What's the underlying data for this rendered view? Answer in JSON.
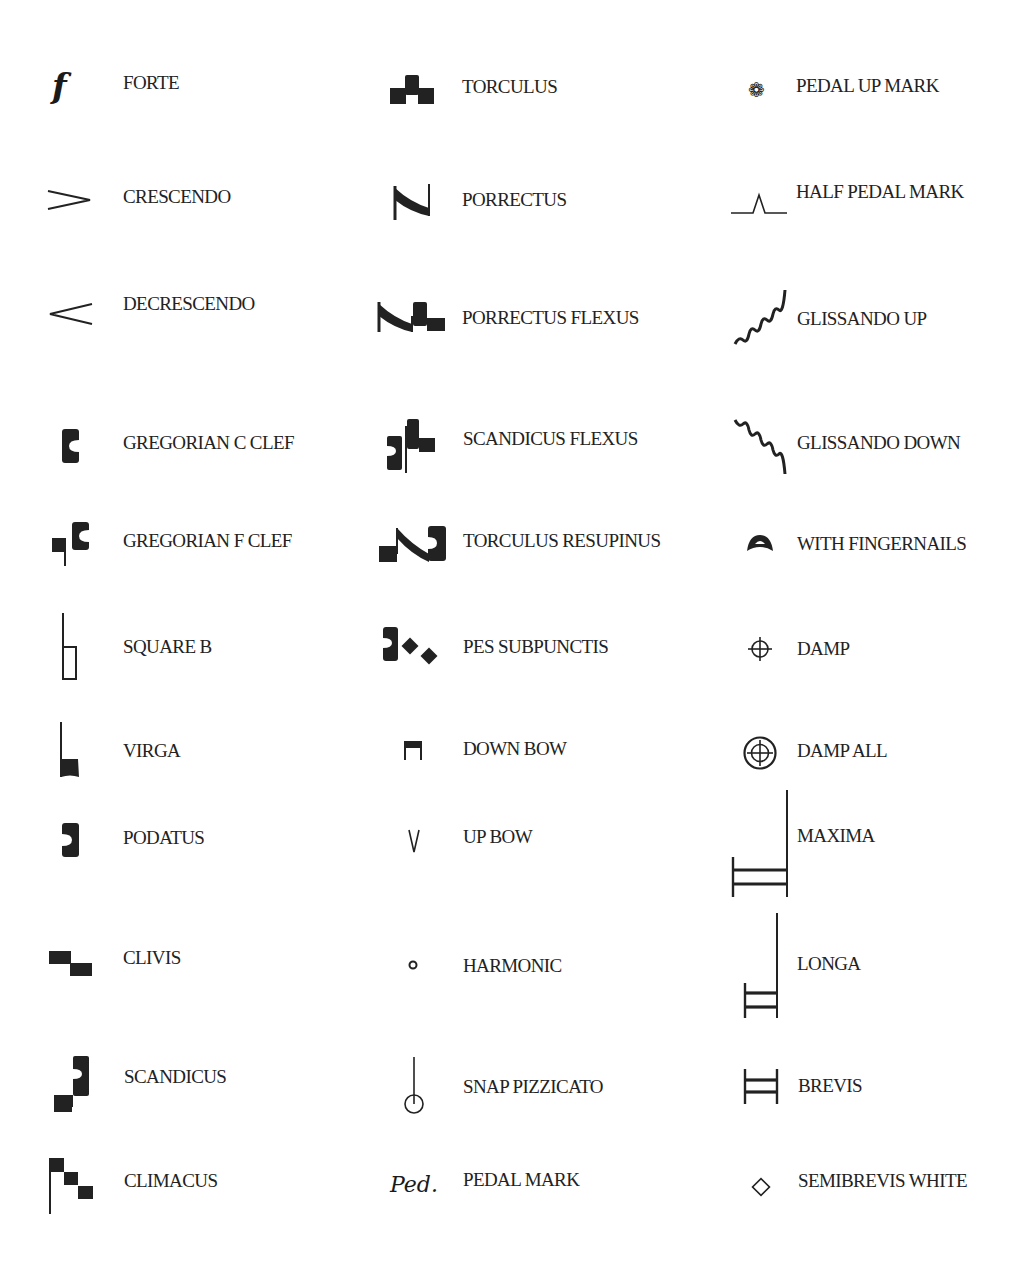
{
  "page": {
    "columns": [
      {
        "items": [
          {
            "label": "FORTE",
            "icon": "forte-icon"
          },
          {
            "label": "CRESCENDO",
            "icon": "crescendo-icon"
          },
          {
            "label": "DECRESCENDO",
            "icon": "decrescendo-icon"
          },
          {
            "label": "GREGORIAN C CLEF",
            "icon": "gregorian-c-clef-icon"
          },
          {
            "label": "GREGORIAN F CLEF",
            "icon": "gregorian-f-clef-icon"
          },
          {
            "label": "SQUARE B",
            "icon": "square-b-icon"
          },
          {
            "label": "VIRGA",
            "icon": "virga-icon"
          },
          {
            "label": "PODATUS",
            "icon": "podatus-icon"
          },
          {
            "label": "CLIVIS",
            "icon": "clivis-icon"
          },
          {
            "label": "SCANDICUS",
            "icon": "scandicus-icon"
          },
          {
            "label": "CLIMACUS",
            "icon": "climacus-icon"
          }
        ]
      },
      {
        "items": [
          {
            "label": "TORCULUS",
            "icon": "torculus-icon"
          },
          {
            "label": "PORRECTUS",
            "icon": "porrectus-icon"
          },
          {
            "label": "PORRECTUS FLEXUS",
            "icon": "porrectus-flexus-icon"
          },
          {
            "label": "SCANDICUS FLEXUS",
            "icon": "scandicus-flexus-icon"
          },
          {
            "label": "TORCULUS RESUPINUS",
            "icon": "torculus-resupinus-icon"
          },
          {
            "label": "PES SUBPUNCTIS",
            "icon": "pes-subpunctis-icon"
          },
          {
            "label": "DOWN BOW",
            "icon": "down-bow-icon"
          },
          {
            "label": "UP BOW",
            "icon": "up-bow-icon"
          },
          {
            "label": "HARMONIC",
            "icon": "harmonic-icon"
          },
          {
            "label": "SNAP PIZZICATO",
            "icon": "snap-pizzicato-icon"
          },
          {
            "label": "PEDAL MARK",
            "icon": "pedal-mark-icon",
            "glyph": "Ped."
          }
        ]
      },
      {
        "items": [
          {
            "label": "PEDAL UP MARK",
            "icon": "pedal-up-mark-icon",
            "glyph": "❁"
          },
          {
            "label": "HALF PEDAL MARK",
            "icon": "half-pedal-mark-icon"
          },
          {
            "label": "GLISSANDO UP",
            "icon": "glissando-up-icon"
          },
          {
            "label": "GLISSANDO DOWN",
            "icon": "glissando-down-icon"
          },
          {
            "label": "WITH FINGERNAILS",
            "icon": "with-fingernails-icon"
          },
          {
            "label": "DAMP",
            "icon": "damp-icon"
          },
          {
            "label": "DAMP ALL",
            "icon": "damp-all-icon"
          },
          {
            "label": "MAXIMA",
            "icon": "maxima-icon"
          },
          {
            "label": "LONGA",
            "icon": "longa-icon"
          },
          {
            "label": "BREVIS",
            "icon": "brevis-icon"
          },
          {
            "label": "SEMIBREVIS WHITE",
            "icon": "semibrevis-white-icon"
          }
        ]
      }
    ],
    "forte_glyph": "f"
  }
}
